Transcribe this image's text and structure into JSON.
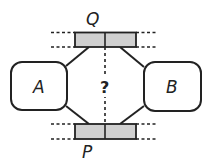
{
  "diagram": {
    "top_label": "Q",
    "bottom_label": "P",
    "left_box_label": "A",
    "right_box_label": "B",
    "center_label": "?",
    "colors": {
      "stroke": "#222222",
      "bar_fill": "#d0d0d0",
      "background": "#ffffff"
    }
  }
}
